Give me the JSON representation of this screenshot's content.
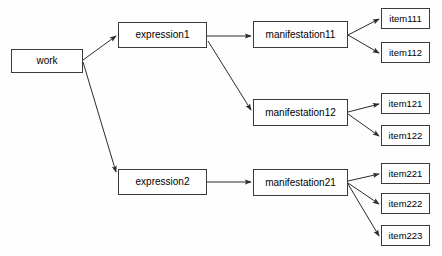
{
  "diagram": {
    "type": "tree-diagram",
    "background_color": "#fefefe",
    "node_fill_color": "#ffffff",
    "node_border_color": "#3a3a3a",
    "edge_color": "#2b2b2b",
    "text_color": "#000000",
    "nodes": [
      {
        "id": "work",
        "label": "work",
        "x": 11,
        "y": 49,
        "w": 72,
        "h": 24,
        "level": "work"
      },
      {
        "id": "expression1",
        "label": "expression1",
        "x": 118,
        "y": 22,
        "w": 89,
        "h": 26,
        "level": "expr"
      },
      {
        "id": "expression2",
        "label": "expression2",
        "x": 118,
        "y": 169,
        "w": 89,
        "h": 26,
        "level": "expr"
      },
      {
        "id": "manifestation11",
        "label": "manifestation11",
        "x": 253,
        "y": 21,
        "w": 95,
        "h": 27,
        "level": "manif"
      },
      {
        "id": "manifestation12",
        "label": "manifestation12",
        "x": 253,
        "y": 99,
        "w": 95,
        "h": 27,
        "level": "manif"
      },
      {
        "id": "manifestation21",
        "label": "manifestation21",
        "x": 253,
        "y": 169,
        "w": 95,
        "h": 27,
        "level": "manif"
      },
      {
        "id": "item111",
        "label": "item111",
        "x": 381,
        "y": 8,
        "w": 49,
        "h": 21,
        "level": "item"
      },
      {
        "id": "item112",
        "label": "item112",
        "x": 381,
        "y": 42,
        "w": 49,
        "h": 21,
        "level": "item"
      },
      {
        "id": "item121",
        "label": "item121",
        "x": 381,
        "y": 93,
        "w": 49,
        "h": 21,
        "level": "item"
      },
      {
        "id": "item122",
        "label": "item122",
        "x": 381,
        "y": 125,
        "w": 49,
        "h": 21,
        "level": "item"
      },
      {
        "id": "item221",
        "label": "item221",
        "x": 381,
        "y": 163,
        "w": 49,
        "h": 21,
        "level": "item"
      },
      {
        "id": "item222",
        "label": "item222",
        "x": 381,
        "y": 193,
        "w": 49,
        "h": 21,
        "level": "item"
      },
      {
        "id": "item223",
        "label": "item223",
        "x": 381,
        "y": 225,
        "w": 49,
        "h": 21,
        "level": "item"
      }
    ],
    "edges": [
      {
        "from": "work",
        "to": "expression1",
        "x1": 83,
        "y1": 60,
        "x2": 116,
        "y2": 36
      },
      {
        "from": "work",
        "to": "expression2",
        "x1": 83,
        "y1": 62,
        "x2": 116,
        "y2": 172
      },
      {
        "from": "expression1",
        "to": "manifestation11",
        "x1": 207,
        "y1": 36,
        "x2": 251,
        "y2": 36
      },
      {
        "from": "expression1",
        "to": "manifestation12",
        "x1": 208,
        "y1": 41,
        "x2": 251,
        "y2": 110
      },
      {
        "from": "expression2",
        "to": "manifestation21",
        "x1": 207,
        "y1": 182,
        "x2": 251,
        "y2": 182
      },
      {
        "from": "manifestation11",
        "to": "item111",
        "x1": 348,
        "y1": 35,
        "x2": 379,
        "y2": 19
      },
      {
        "from": "manifestation11",
        "to": "item112",
        "x1": 348,
        "y1": 35,
        "x2": 379,
        "y2": 53
      },
      {
        "from": "manifestation12",
        "to": "item121",
        "x1": 348,
        "y1": 112,
        "x2": 379,
        "y2": 104
      },
      {
        "from": "manifestation12",
        "to": "item122",
        "x1": 348,
        "y1": 114,
        "x2": 379,
        "y2": 136
      },
      {
        "from": "manifestation21",
        "to": "item221",
        "x1": 348,
        "y1": 181,
        "x2": 379,
        "y2": 174
      },
      {
        "from": "manifestation21",
        "to": "item222",
        "x1": 348,
        "y1": 183,
        "x2": 379,
        "y2": 204
      },
      {
        "from": "manifestation21",
        "to": "item223",
        "x1": 348,
        "y1": 184,
        "x2": 379,
        "y2": 236
      }
    ]
  }
}
